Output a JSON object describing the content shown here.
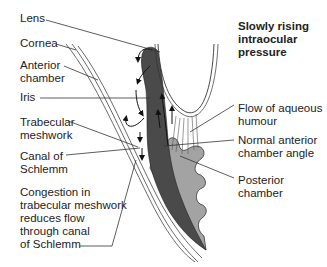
{
  "title": {
    "line1": "Slowly rising",
    "line2": "intraocular",
    "line3": "pressure"
  },
  "left_labels": {
    "lens": "Lens",
    "cornea": "Cornea",
    "anterior_chamber_1": "Anterior",
    "anterior_chamber_2": "chamber",
    "iris": "Iris",
    "trabecular_1": "Trabecular",
    "trabecular_2": "meshwork",
    "canal_1": "Canal of",
    "canal_2": "Schlemm",
    "congestion_1": "Congestion in",
    "congestion_2": "trabecular meshwork",
    "congestion_3": "reduces flow",
    "congestion_4": "through canal",
    "congestion_5": "of Schlemm"
  },
  "right_labels": {
    "flow_1": "Flow of aqueous",
    "flow_2": "humour",
    "angle_1": "Normal anterior",
    "angle_2": "chamber angle",
    "posterior_1": "Posterior",
    "posterior_2": "chamber"
  },
  "colors": {
    "iris_dark": "#4a4a4a",
    "ciliary_gray": "#9a9a9a",
    "line": "#333333",
    "background": "#ffffff"
  }
}
